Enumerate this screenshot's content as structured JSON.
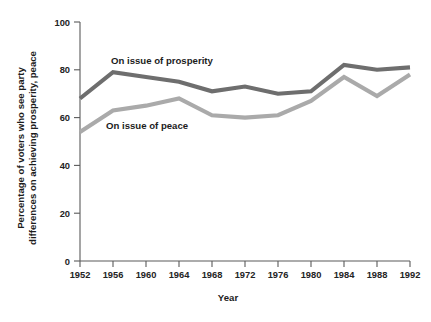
{
  "chart_data": {
    "type": "line",
    "title": "",
    "xlabel": "Year",
    "ylabel": "Percentage of voters who see party differences on achieving prosperity, peace",
    "ylabel_line1": "Percentage of voters who see party",
    "ylabel_line2": "differences on achieving prosperity, peace",
    "categories": [
      1952,
      1956,
      1960,
      1964,
      1968,
      1972,
      1976,
      1980,
      1984,
      1988,
      1992
    ],
    "x_tick_labels": [
      "1952",
      "1956",
      "1960",
      "1964",
      "1968",
      "1972",
      "1976",
      "1980",
      "1984",
      "1988",
      "1992"
    ],
    "y_tick_labels": [
      "0",
      "20",
      "40",
      "60",
      "80",
      "100"
    ],
    "y_ticks": [
      0,
      20,
      40,
      60,
      80,
      100
    ],
    "ylim": [
      0,
      100
    ],
    "xlim": [
      1952,
      1992
    ],
    "grid": false,
    "legend_position": "inline-annotation",
    "series": [
      {
        "name": "On issue of prosperity",
        "label": "On issue of prosperity",
        "color": "#6e6e6e",
        "values": [
          68,
          79,
          77,
          75,
          71,
          73,
          70,
          71,
          82,
          80,
          81
        ]
      },
      {
        "name": "On issue of peace",
        "label": "On issue of peace",
        "color": "#aaaaaa",
        "values": [
          54,
          63,
          65,
          68,
          61,
          60,
          61,
          67,
          77,
          69,
          78
        ]
      }
    ],
    "annotations": [
      {
        "text": "On issue of prosperity",
        "x": 1956.6,
        "y": 86
      },
      {
        "text": "On issue of peace",
        "x": 1956.9,
        "y": 55
      }
    ]
  }
}
